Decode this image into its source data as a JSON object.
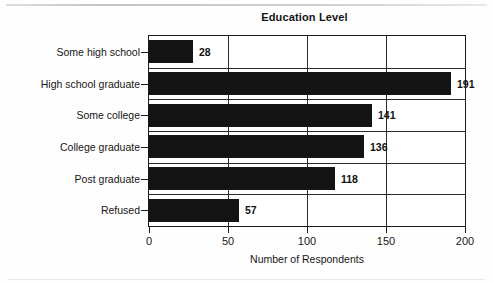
{
  "chart_data": {
    "type": "bar",
    "orientation": "horizontal",
    "title": "Education Level",
    "xlabel": "Number of Respondents",
    "ylabel": "",
    "categories": [
      "Some high school",
      "High school graduate",
      "Some college",
      "College graduate",
      "Post graduate",
      "Refused"
    ],
    "values": [
      28,
      191,
      141,
      136,
      118,
      57
    ],
    "value_labels": [
      "28",
      "191",
      "141",
      "136",
      "118",
      "57"
    ],
    "xlim": [
      0,
      200
    ],
    "xticks": [
      0,
      50,
      100,
      150,
      200
    ],
    "xticklabels": [
      "0",
      "50",
      "100",
      "150",
      "200"
    ],
    "grid": true,
    "legend": false,
    "bar_color": "#141414",
    "frame_color": "#1a1a1a",
    "background": "#ffffff"
  }
}
